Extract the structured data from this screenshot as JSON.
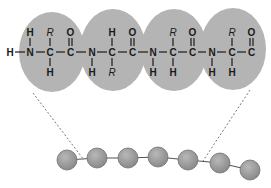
{
  "diagram": {
    "type": "peptide-backbone-schematic",
    "colors": {
      "residue_oval": "#b4b4b4",
      "bead": "#9a9a9a",
      "bead_stroke": "#707070",
      "text": "#1a1a1a",
      "dashed_line": "#555555"
    },
    "backbone": {
      "n_terminal": "H",
      "bond": "—",
      "residues": [
        {
          "n": "N",
          "n_h": "H",
          "n_h_pos": "top",
          "ca": "C",
          "ca_top": "R",
          "ca_bottom": "H",
          "c": "C",
          "c_o": "O"
        },
        {
          "n": "N",
          "n_h": "H",
          "n_h_pos": "bottom",
          "ca": "C",
          "ca_top": "H",
          "ca_bottom": "R",
          "c": "C",
          "c_o": "O"
        },
        {
          "n": "N",
          "n_h": "H",
          "n_h_pos": "bottom",
          "ca": "C",
          "ca_top": "R",
          "ca_bottom": "H",
          "c": "C",
          "c_o": "O"
        },
        {
          "n": "N",
          "n_h": "H",
          "n_h_pos": "bottom",
          "ca": "C",
          "ca_top": "R",
          "ca_bottom": "H",
          "c": "C",
          "c_o": "O"
        }
      ]
    },
    "bead_chain": {
      "bead_count": 7
    }
  }
}
